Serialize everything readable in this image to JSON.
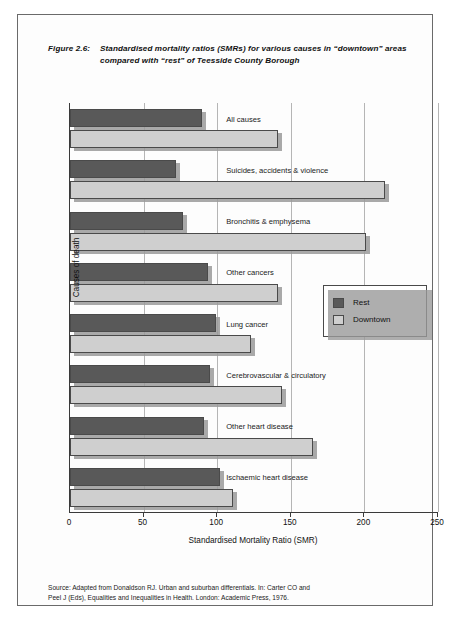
{
  "figure": {
    "number": "Figure 2.6:",
    "title": "Standardised mortality ratios (SMRs) for various causes in “downtown” areas compared with “rest” of Teesside County Borough",
    "source": {
      "line1": "Source: Adapted from Donaldson RJ. Urban and suburban differentials. In: Carter CO and",
      "line2": "Peel J (Eds), Equalities and Inequalities in Health. London: Academic Press, 1976."
    }
  },
  "legend": {
    "position": "inside-right",
    "items": [
      {
        "label": "Rest",
        "color": "#595959"
      },
      {
        "label": "Downtown",
        "color": "#cfcfcf"
      }
    ]
  },
  "chart_data": {
    "type": "bar",
    "orientation": "horizontal",
    "title": "Standardised mortality ratios (SMRs) for various causes in “downtown” areas compared with “rest” of Teesside County Borough",
    "xlabel": "Standardised Mortality Ratio (SMR)",
    "ylabel": "Causes of death",
    "xlim": [
      0,
      250
    ],
    "xticks": [
      0,
      50,
      100,
      150,
      200,
      250
    ],
    "grid": "vertical",
    "categories": [
      "All causes",
      "Suicides, accidents & violence",
      "Bronchitis & emphysema",
      "Other cancers",
      "Lung cancer",
      "Cerebrovascular & circulatory",
      "Other heart disease",
      "Ischaemic heart disease"
    ],
    "series": [
      {
        "name": "Rest",
        "color": "#595959",
        "values": [
          90,
          72,
          77,
          94,
          99,
          95,
          91,
          102
        ]
      },
      {
        "name": "Downtown",
        "color": "#cfcfcf",
        "values": [
          141,
          214,
          201,
          141,
          123,
          144,
          165,
          111
        ]
      }
    ]
  }
}
